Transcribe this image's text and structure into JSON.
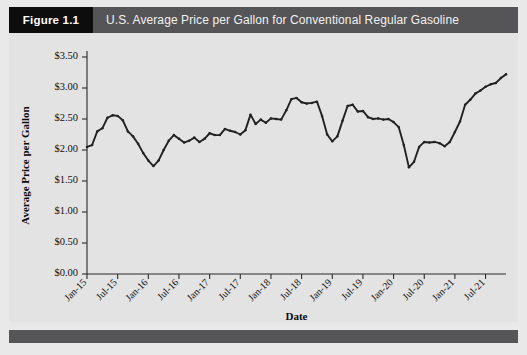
{
  "figure": {
    "tag": "Figure 1.1",
    "title": "U.S. Average Price per Gallon for Conventional Regular Gasoline"
  },
  "colors": {
    "tag_background": "#0d0d0d",
    "title_background": "#555456",
    "title_text": "#f2f2f2",
    "page_background": "#e9e9e9",
    "plot_background": "#e3e3e3",
    "line": "#222222",
    "axis": "#2a2a2a",
    "footer": "#565557"
  },
  "chart_data": {
    "type": "line",
    "title": "U.S. Average Price per Gallon for Conventional Regular Gasoline",
    "xlabel": "Date",
    "ylabel": "Average Price per Gallon",
    "grid": false,
    "legend": null,
    "ylim": [
      0.0,
      3.5
    ],
    "ytick_labels": [
      "$0.00",
      "$0.50",
      "$1.00",
      "$1.50",
      "$2.00",
      "$2.50",
      "$3.00",
      "$3.50"
    ],
    "ytick_values": [
      0.0,
      0.5,
      1.0,
      1.5,
      2.0,
      2.5,
      3.0,
      3.5
    ],
    "xtick_labels": [
      "Jan-15",
      "Jul-15",
      "Jan-16",
      "Jul-16",
      "Jan-17",
      "Jul-17",
      "Jan-18",
      "Jul-18",
      "Jan-19",
      "Jul-19",
      "Jan-20",
      "Jul-20",
      "Jan-21",
      "Jul-21"
    ],
    "xtick_indices": [
      0,
      6,
      12,
      18,
      24,
      30,
      36,
      42,
      48,
      54,
      60,
      66,
      72,
      78
    ],
    "x": [
      "Jan-15",
      "Feb-15",
      "Mar-15",
      "Apr-15",
      "May-15",
      "Jun-15",
      "Jul-15",
      "Aug-15",
      "Sep-15",
      "Oct-15",
      "Nov-15",
      "Dec-15",
      "Jan-16",
      "Feb-16",
      "Mar-16",
      "Apr-16",
      "May-16",
      "Jun-16",
      "Jul-16",
      "Aug-16",
      "Sep-16",
      "Oct-16",
      "Nov-16",
      "Dec-16",
      "Jan-17",
      "Feb-17",
      "Mar-17",
      "Apr-17",
      "May-17",
      "Jun-17",
      "Jul-17",
      "Aug-17",
      "Sep-17",
      "Oct-17",
      "Nov-17",
      "Dec-17",
      "Jan-18",
      "Feb-18",
      "Mar-18",
      "Apr-18",
      "May-18",
      "Jun-18",
      "Jul-18",
      "Aug-18",
      "Sep-18",
      "Oct-18",
      "Nov-18",
      "Dec-18",
      "Jan-19",
      "Feb-19",
      "Mar-19",
      "Apr-19",
      "May-19",
      "Jun-19",
      "Jul-19",
      "Aug-19",
      "Sep-19",
      "Oct-19",
      "Nov-19",
      "Dec-19",
      "Jan-20",
      "Feb-20",
      "Mar-20",
      "Apr-20",
      "May-20",
      "Jun-20",
      "Jul-20",
      "Aug-20",
      "Sep-20",
      "Oct-20",
      "Nov-20",
      "Dec-20",
      "Jan-21",
      "Feb-21",
      "Mar-21",
      "Apr-21",
      "May-21",
      "Jun-21",
      "Jul-21",
      "Aug-21",
      "Sep-21",
      "Oct-21",
      "Nov-21"
    ],
    "series": [
      {
        "name": "U.S. Average Price per Gallon (Conventional Regular Gasoline)",
        "values": [
          2.05,
          2.08,
          2.3,
          2.35,
          2.52,
          2.56,
          2.55,
          2.48,
          2.3,
          2.22,
          2.1,
          1.95,
          1.83,
          1.74,
          1.83,
          2.0,
          2.15,
          2.24,
          2.18,
          2.12,
          2.15,
          2.2,
          2.13,
          2.18,
          2.27,
          2.24,
          2.24,
          2.34,
          2.31,
          2.29,
          2.25,
          2.32,
          2.57,
          2.42,
          2.49,
          2.44,
          2.51,
          2.5,
          2.49,
          2.64,
          2.82,
          2.84,
          2.77,
          2.75,
          2.76,
          2.78,
          2.55,
          2.25,
          2.14,
          2.22,
          2.47,
          2.71,
          2.73,
          2.62,
          2.63,
          2.53,
          2.5,
          2.51,
          2.49,
          2.5,
          2.45,
          2.37,
          2.08,
          1.72,
          1.81,
          2.05,
          2.13,
          2.12,
          2.13,
          2.11,
          2.06,
          2.13,
          2.29,
          2.46,
          2.73,
          2.81,
          2.91,
          2.96,
          3.02,
          3.06,
          3.08,
          3.16,
          3.22
        ]
      }
    ]
  }
}
